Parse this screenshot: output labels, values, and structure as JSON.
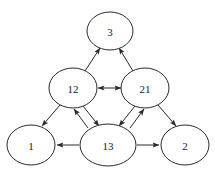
{
  "diagram": {
    "type": "directed-graph",
    "background_color": "#ffffff",
    "node_fill_color": "#ffffff",
    "node_stroke_color": "#2a2a2a",
    "edge_color": "#2a2a2a",
    "label_color": "#1a1a1a",
    "node_count": 6,
    "edge_count": 9,
    "nodes": [
      {
        "id": "n3",
        "label": "3",
        "cx": 110,
        "cy": 31,
        "rx": 23,
        "ry": 19
      },
      {
        "id": "n12",
        "label": "12",
        "cx": 73,
        "cy": 88,
        "rx": 24,
        "ry": 20
      },
      {
        "id": "n21",
        "label": "21",
        "cx": 145,
        "cy": 88,
        "rx": 24,
        "ry": 20
      },
      {
        "id": "n1",
        "label": "1",
        "cx": 31,
        "cy": 145,
        "rx": 24,
        "ry": 20
      },
      {
        "id": "n13",
        "label": "13",
        "cx": 108,
        "cy": 145,
        "rx": 28,
        "ry": 21
      },
      {
        "id": "n2",
        "label": "2",
        "cx": 185,
        "cy": 145,
        "rx": 24,
        "ry": 20
      }
    ],
    "edges": [
      {
        "id": "e1",
        "from": "12",
        "to": "3",
        "direction": "single",
        "x1": 85,
        "y1": 71,
        "x2": 100,
        "y2": 48
      },
      {
        "id": "e2",
        "from": "21",
        "to": "3",
        "direction": "single",
        "x1": 133,
        "y1": 71,
        "x2": 119,
        "y2": 48
      },
      {
        "id": "e3",
        "from": "12",
        "to": "21",
        "direction": "double",
        "x1": 98,
        "y1": 88,
        "x2": 121,
        "y2": 88
      },
      {
        "id": "e4",
        "from": "12",
        "to": "1",
        "direction": "single",
        "x1": 60,
        "y1": 105,
        "x2": 42,
        "y2": 126
      },
      {
        "id": "e5",
        "from": "12",
        "to": "13",
        "direction": "single",
        "x1": 83,
        "y1": 106,
        "x2": 99,
        "y2": 126
      },
      {
        "id": "e6",
        "from": "13",
        "to": "12",
        "direction": "single",
        "x1": 88,
        "y1": 128,
        "x2": 74,
        "y2": 109
      },
      {
        "id": "e7",
        "from": "13",
        "to": "21",
        "direction": "single",
        "x1": 130,
        "y1": 128,
        "x2": 144,
        "y2": 109
      },
      {
        "id": "e8",
        "from": "21",
        "to": "13",
        "direction": "single",
        "x1": 135,
        "y1": 106,
        "x2": 119,
        "y2": 126
      },
      {
        "id": "e9",
        "from": "21",
        "to": "2",
        "direction": "single",
        "x1": 158,
        "y1": 105,
        "x2": 176,
        "y2": 126
      },
      {
        "id": "e10",
        "from": "13",
        "to": "1",
        "direction": "single",
        "x1": 79,
        "y1": 145,
        "x2": 57,
        "y2": 145
      },
      {
        "id": "e11",
        "from": "13",
        "to": "2",
        "direction": "single",
        "x1": 137,
        "y1": 145,
        "x2": 159,
        "y2": 145
      }
    ]
  }
}
